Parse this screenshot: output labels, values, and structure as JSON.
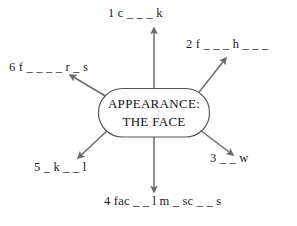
{
  "diagram": {
    "type": "spider-diagram",
    "center": {
      "line1": "APPEARANCE:",
      "line2": "THE FACE",
      "shape": "rounded-rectangle",
      "stroke_color": "#555555",
      "fill_color": "#ffffff"
    },
    "arrow_color": "#6b6b6b",
    "branches": [
      {
        "number": "1",
        "gap_text": "c _ _ _ k",
        "label": "1 c _ _ _ k",
        "direction": "up"
      },
      {
        "number": "2",
        "gap_text": "f _ _ _ h _ _ _",
        "label": "2 f _ _ _ h _ _ _",
        "direction": "up-right"
      },
      {
        "number": "3",
        "gap_text": "_ _ w",
        "label": "3 _ _ w",
        "direction": "down-right"
      },
      {
        "number": "4",
        "gap_text": "fac _ _ l m _ sc _ _ s",
        "label": "4 fac _ _ l m _ sc _ _ s",
        "direction": "down"
      },
      {
        "number": "5",
        "gap_text": "_ k _ _ l",
        "label": "5 _ k _ _ l",
        "direction": "down-left"
      },
      {
        "number": "6",
        "gap_text": "f _ _ _ _ r _ s",
        "label": "6 f _ _ _ _ r _ s",
        "direction": "up-left"
      }
    ]
  }
}
